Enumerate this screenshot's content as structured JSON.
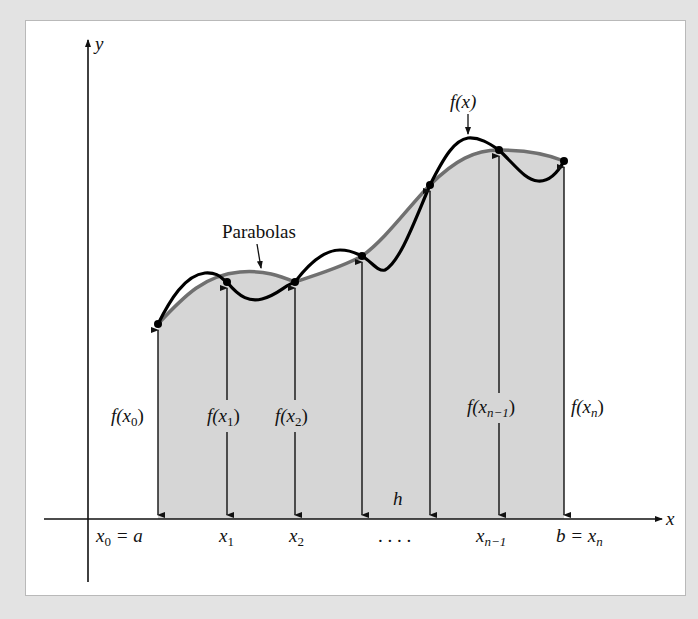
{
  "figure": {
    "background_color": "#e3e3e3",
    "panel_color": "#ffffff",
    "shade_color": "#d6d6d6",
    "parabola_color": "#707070",
    "curve_color": "#000000"
  },
  "axes": {
    "x_label": "x",
    "y_label": "y",
    "origin": [
      88,
      519
    ],
    "x_axis_start": 44,
    "x_axis_end": 662,
    "y_axis_top": 40,
    "y_axis_bottom": 582
  },
  "points": [
    {
      "id": "x0",
      "x": 158,
      "y": 324,
      "height_label": {
        "f": "f(",
        "var": "x",
        "sub": "0",
        "close": ")"
      },
      "axis_label": {
        "var": "x",
        "sub": "0",
        "suffix": " = a"
      }
    },
    {
      "id": "x1",
      "x": 227,
      "y": 282,
      "height_label": {
        "f": "f(",
        "var": "x",
        "sub": "1",
        "close": ")"
      },
      "axis_label": {
        "var": "x",
        "sub": "1",
        "suffix": ""
      }
    },
    {
      "id": "x2",
      "x": 295,
      "y": 282,
      "height_label": {
        "f": "f(",
        "var": "x",
        "sub": "2",
        "close": ")"
      },
      "axis_label": {
        "var": "x",
        "sub": "2",
        "suffix": ""
      }
    },
    {
      "id": "x3",
      "x": 362,
      "y": 256
    },
    {
      "id": "x4",
      "x": 430,
      "y": 185
    },
    {
      "id": "xn-1",
      "x": 499,
      "y": 150,
      "height_label": {
        "f": "f(",
        "var": "x",
        "sub": "n−1",
        "close": ")"
      },
      "axis_label": {
        "var": "x",
        "sub": "n−1",
        "suffix": ""
      }
    },
    {
      "id": "xn",
      "x": 564,
      "y": 161,
      "height_label": {
        "f": "f(",
        "var": "x",
        "sub": "n",
        "close": ")"
      },
      "axis_label": {
        "prefix": "b = ",
        "var": "x",
        "sub": "n",
        "suffix": ""
      }
    }
  ],
  "labels": {
    "parabolas": "Parabolas",
    "fx": "f(x)",
    "h": "h",
    "ellipsis": ". . . .",
    "f_x0": {
      "f": "f(",
      "var": "x",
      "sub": "0",
      "close": ")"
    },
    "f_x1": {
      "f": "f(",
      "var": "x",
      "sub": "1",
      "close": ")"
    },
    "f_x2": {
      "f": "f(",
      "var": "x",
      "sub": "2",
      "close": ")"
    },
    "f_xn1": {
      "f": "f(",
      "var": "x",
      "sub": "n−1",
      "close": ")"
    },
    "f_xn": {
      "f": "f(",
      "var": "x",
      "sub": "n",
      "close": ")"
    },
    "x0_eq_a": {
      "var": "x",
      "sub": "0",
      "suffix": " = a"
    },
    "x1": {
      "var": "x",
      "sub": "1"
    },
    "x2": {
      "var": "x",
      "sub": "2"
    },
    "xn1": {
      "var": "x",
      "sub": "n−1"
    },
    "b_eq_xn": {
      "prefix": "b = ",
      "var": "x",
      "sub": "n"
    }
  }
}
